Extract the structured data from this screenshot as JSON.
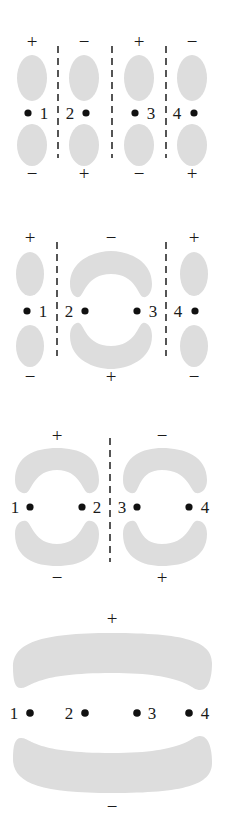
{
  "figure": {
    "lobe_color": "#dddddd",
    "dot_color": "#111111",
    "node_line_color": "#2b2b2b",
    "background_color": "#ffffff",
    "atom_count": 4
  },
  "panels": [
    {
      "name": "psi-4",
      "nodes": 3,
      "atoms": [
        {
          "label": "1",
          "label_side": "right",
          "top_sign": "+",
          "bottom_sign": "−"
        },
        {
          "label": "2",
          "label_side": "left",
          "top_sign": "−",
          "bottom_sign": "+"
        },
        {
          "label": "3",
          "label_side": "right",
          "top_sign": "+",
          "bottom_sign": "−"
        },
        {
          "label": "4",
          "label_side": "left",
          "top_sign": "−",
          "bottom_sign": "+"
        }
      ],
      "top_signs": [
        "+",
        "−",
        "+",
        "−"
      ],
      "bottom_signs": [
        "−",
        "+",
        "−",
        "+"
      ]
    },
    {
      "name": "psi-3",
      "nodes": 2,
      "atoms": [
        {
          "label": "1",
          "label_side": "right",
          "top_sign": "+",
          "bottom_sign": "−"
        },
        {
          "label": "2",
          "label_side": "left",
          "top_sign": "−",
          "bottom_sign": "+"
        },
        {
          "label": "3",
          "label_side": "right",
          "top_sign": "−",
          "bottom_sign": "+"
        },
        {
          "label": "4",
          "label_side": "left",
          "top_sign": "+",
          "bottom_sign": "−"
        }
      ],
      "top_signs": [
        "+",
        "−",
        "+"
      ],
      "bottom_signs": [
        "−",
        "+",
        "−"
      ]
    },
    {
      "name": "psi-2",
      "nodes": 1,
      "atoms": [
        {
          "label": "1",
          "label_side": "left",
          "top_sign": "+",
          "bottom_sign": "−"
        },
        {
          "label": "2",
          "label_side": "right",
          "top_sign": "+",
          "bottom_sign": "−"
        },
        {
          "label": "3",
          "label_side": "right",
          "top_sign": "−",
          "bottom_sign": "+"
        },
        {
          "label": "4",
          "label_side": "left",
          "top_sign": "−",
          "bottom_sign": "+"
        }
      ],
      "top_signs": [
        "+",
        "−"
      ],
      "bottom_signs": [
        "−",
        "+"
      ]
    },
    {
      "name": "psi-1",
      "nodes": 0,
      "atoms": [
        {
          "label": "1",
          "label_side": "left",
          "top_sign": "+",
          "bottom_sign": "−"
        },
        {
          "label": "2",
          "label_side": "left",
          "top_sign": "+",
          "bottom_sign": "−"
        },
        {
          "label": "3",
          "label_side": "right",
          "top_sign": "+",
          "bottom_sign": "−"
        },
        {
          "label": "4",
          "label_side": "right",
          "top_sign": "+",
          "bottom_sign": "−"
        }
      ],
      "top_signs": [
        "+"
      ],
      "bottom_signs": [
        "−"
      ]
    }
  ],
  "labels": {
    "psi4": {
      "atom1": "1",
      "atom2": "2",
      "atom3": "3",
      "atom4": "4",
      "top1": "+",
      "top2": "−",
      "top3": "+",
      "top4": "−",
      "bot1": "−",
      "bot2": "+",
      "bot3": "−",
      "bot4": "+"
    },
    "psi3": {
      "atom1": "1",
      "atom2": "2",
      "atom3": "3",
      "atom4": "4",
      "top1": "+",
      "top2": "−",
      "top3": "+",
      "bot1": "−",
      "bot2": "+",
      "bot3": "−"
    },
    "psi2": {
      "atom1": "1",
      "atom2": "2",
      "atom3": "3",
      "atom4": "4",
      "top1": "+",
      "top2": "−",
      "bot1": "−",
      "bot2": "+"
    },
    "psi1": {
      "atom1": "1",
      "atom2": "2",
      "atom3": "3",
      "atom4": "4",
      "top1": "+",
      "bot1": "−"
    }
  }
}
